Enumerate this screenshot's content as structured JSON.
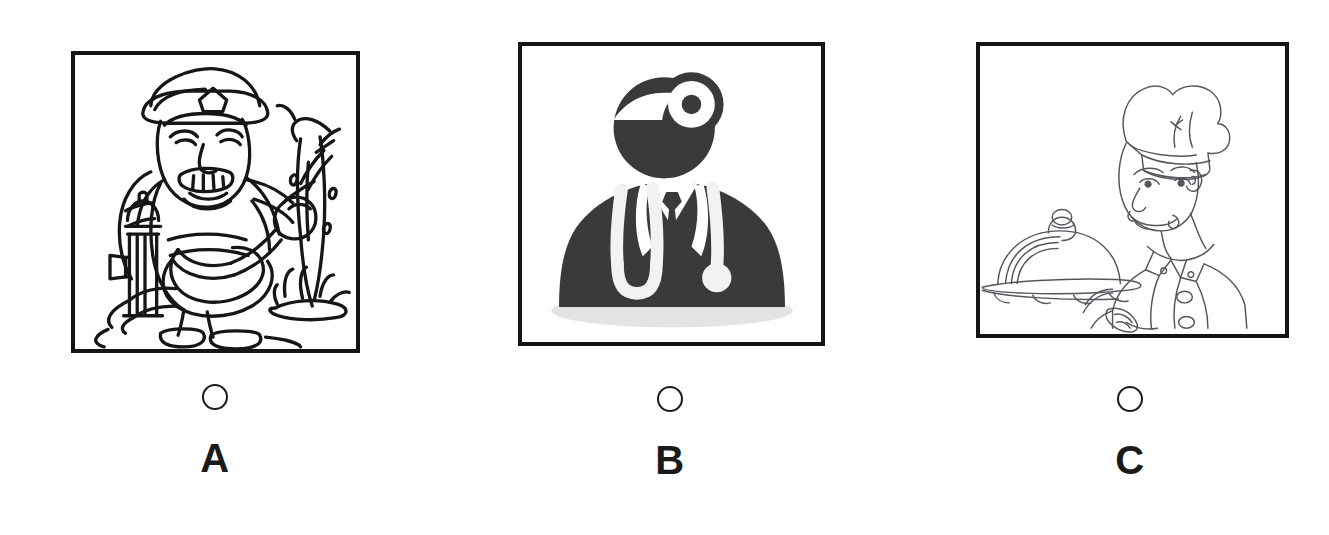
{
  "page": {
    "background_color": "#ffffff",
    "layout": "three-option picture choice row",
    "ink_color": "#151515",
    "silhouette_color": "#3a3a3a"
  },
  "options": [
    {
      "id": "a",
      "letter": "A",
      "radio_name": "radio-option-a",
      "radio_selected": false,
      "picture": {
        "name": "firefighter-illustration",
        "style": "black-and-white line art",
        "subject": "firefighter spraying water from a hose",
        "elements": [
          "fire helmet",
          "mustached face",
          "turnout coat",
          "fire hose",
          "fire hydrant",
          "water jet",
          "puddle",
          "boots"
        ]
      }
    },
    {
      "id": "b",
      "letter": "B",
      "radio_name": "radio-option-b",
      "radio_selected": false,
      "picture": {
        "name": "doctor-silhouette-illustration",
        "style": "solid dark silhouette icon",
        "subject": "doctor wearing a head mirror and stethoscope",
        "elements": [
          "head mirror",
          "stethoscope",
          "suit jacket",
          "necktie",
          "shirt collar",
          "drop shadow"
        ]
      }
    },
    {
      "id": "c",
      "letter": "C",
      "radio_name": "radio-option-c",
      "radio_selected": false,
      "picture": {
        "name": "chef-illustration",
        "style": "thin pencil line art",
        "subject": "smiling chef holding a covered serving tray",
        "elements": [
          "chef toque hat",
          "smiling face",
          "double-breasted chef jacket",
          "cloche dome cover",
          "oval serving platter",
          "hand"
        ]
      }
    }
  ]
}
